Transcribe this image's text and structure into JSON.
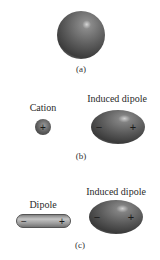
{
  "figure": {
    "panels": [
      {
        "id": "a",
        "caption": "(a)",
        "objects": [
          {
            "type": "neutral-atom",
            "label": ""
          }
        ]
      },
      {
        "id": "b",
        "caption": "(b)",
        "objects": [
          {
            "type": "cation",
            "label": "Cation",
            "charge": "+"
          },
          {
            "type": "induced-dipole",
            "label": "Induced dipole",
            "left_charge": "−",
            "right_charge": "+"
          }
        ]
      },
      {
        "id": "c",
        "caption": "(c)",
        "objects": [
          {
            "type": "dipole",
            "label": "Dipole",
            "left_charge": "−",
            "right_charge": "+"
          },
          {
            "type": "induced-dipole",
            "label": "Induced dipole",
            "left_charge": "−",
            "right_charge": "+"
          }
        ]
      }
    ],
    "colors": {
      "sphere_dark": "#3a3a3a",
      "sphere_mid": "#6b6b6b",
      "sphere_highlight": "#c8c8c8",
      "capsule_fill": "#9a9a9a",
      "capsule_outline": "#5a5a5a",
      "background": "#ffffff"
    }
  }
}
